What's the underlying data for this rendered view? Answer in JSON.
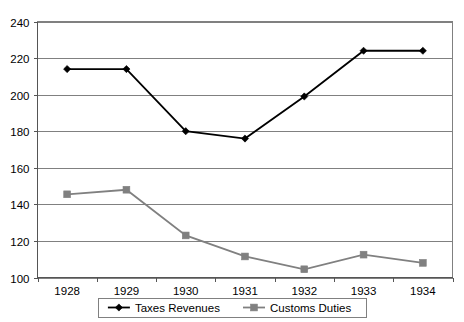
{
  "chart_data": {
    "type": "line",
    "title": "",
    "subtitle": "",
    "xlabel": "",
    "ylabel": "",
    "categories": [
      "1928",
      "1929",
      "1930",
      "1931",
      "1932",
      "1933",
      "1934"
    ],
    "series": [
      {
        "name": "Taxes Revenues",
        "marker": "diamond",
        "color": "#000000",
        "values": [
          214,
          214,
          180,
          176,
          199,
          224,
          224
        ]
      },
      {
        "name": "Customs Duties",
        "marker": "square",
        "color": "#808080",
        "values": [
          145.5,
          148,
          123,
          111.5,
          104.5,
          112.5,
          108
        ]
      }
    ],
    "ylim": [
      100,
      240
    ],
    "yticks": [
      100,
      120,
      140,
      160,
      180,
      200,
      220,
      240
    ],
    "ytick_labels": [
      "100",
      "120",
      "140",
      "160",
      "180",
      "200",
      "220",
      "240"
    ],
    "xtick_labels": [
      "1928",
      "1929",
      "1930",
      "1931",
      "1932",
      "1933",
      "1934"
    ],
    "grid": "horizontal",
    "legend_position": "bottom"
  },
  "legend": {
    "entries": [
      {
        "label": "Taxes Revenues",
        "color": "#000000",
        "marker": "diamond"
      },
      {
        "label": "Customs Duties",
        "color": "#808080",
        "marker": "square"
      }
    ]
  }
}
